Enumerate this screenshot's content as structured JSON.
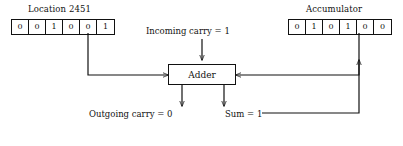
{
  "diagram": {
    "left_register": {
      "title": "Location 2451",
      "bits": [
        "0",
        "0",
        "1",
        "0",
        "0",
        "1"
      ]
    },
    "right_register": {
      "title": "Accumulator",
      "bits": [
        "0",
        "1",
        "0",
        "1",
        "0",
        "0"
      ]
    },
    "adder": {
      "label": "Adder"
    },
    "labels": {
      "incoming_carry": "Incoming carry = 1",
      "outgoing_carry": "Outgoing carry = 0",
      "sum": "Sum = 1"
    },
    "colors": {
      "ink": "#111111",
      "paper": "#ffffff"
    }
  }
}
